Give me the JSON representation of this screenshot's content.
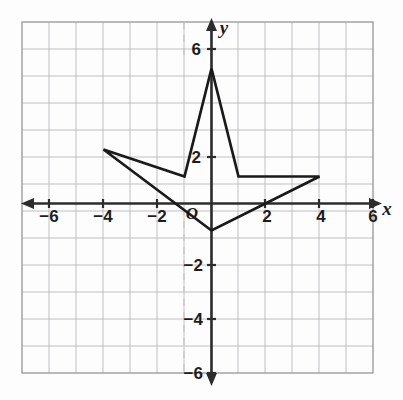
{
  "figure": {
    "axis_x_label": "x",
    "axis_y_label": "y",
    "origin_label": "O",
    "colors": {
      "grid": "#b9b9bd",
      "axis": "#2c2c2c",
      "shape_stroke": "#1a1a1a",
      "background": "#fdfdfd"
    }
  },
  "chart_data": {
    "type": "scatter",
    "title": "",
    "xlabel": "x",
    "ylabel": "y",
    "xlim": [
      -7,
      7
    ],
    "ylim": [
      -7,
      7
    ],
    "grid": true,
    "grid_step": 1,
    "legend": "none",
    "x_tick_labels": [
      "−6",
      "−4",
      "−2",
      "2",
      "4",
      "6"
    ],
    "x_tick_values": [
      -6,
      -4,
      -2,
      2,
      4,
      6
    ],
    "y_tick_labels": [
      "6",
      "2",
      "−2",
      "−4",
      "−6"
    ],
    "y_tick_values": [
      6,
      2,
      -2,
      -4,
      -6
    ],
    "series": [
      {
        "name": "arrow-polygon",
        "type": "closed-polygon",
        "closed": true,
        "vertices": [
          {
            "x": 0,
            "y": 5
          },
          {
            "x": 1,
            "y": 1
          },
          {
            "x": 4,
            "y": 1
          },
          {
            "x": 0,
            "y": -1
          },
          {
            "x": -4,
            "y": 2
          },
          {
            "x": -1,
            "y": 1
          }
        ]
      }
    ]
  }
}
